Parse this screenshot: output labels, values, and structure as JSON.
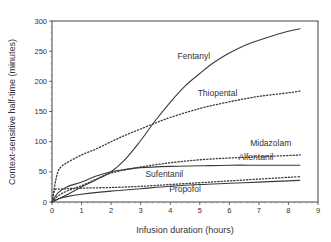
{
  "chart_data": {
    "type": "line",
    "title": "",
    "xlabel": "Infusion duration (hours)",
    "ylabel": "Context-sensitive half-time (minutes)",
    "xlim": [
      0,
      9
    ],
    "ylim": [
      0,
      300
    ],
    "xticks": [
      0,
      1,
      2,
      3,
      4,
      5,
      6,
      7,
      8,
      9
    ],
    "yticks": [
      0,
      50,
      100,
      150,
      200,
      250,
      300
    ],
    "grid": false,
    "legend": "none (inline labels)",
    "series": [
      {
        "name": "Fentanyl",
        "style": "solid",
        "x": [
          0,
          0.5,
          1,
          1.5,
          2,
          2.5,
          3,
          3.5,
          4,
          4.5,
          5,
          5.5,
          6,
          6.5,
          7,
          7.5,
          8,
          8.4
        ],
        "y": [
          0,
          12,
          25,
          37,
          50,
          72,
          102,
          135,
          165,
          192,
          213,
          232,
          247,
          259,
          268,
          276,
          283,
          287
        ]
      },
      {
        "name": "Thiopental",
        "style": "dotted",
        "x": [
          0,
          0.1,
          0.2,
          0.3,
          0.5,
          1,
          1.5,
          2,
          2.5,
          3,
          3.5,
          4,
          5,
          6,
          7,
          8,
          8.4
        ],
        "y": [
          0,
          30,
          50,
          58,
          65,
          78,
          88,
          100,
          111,
          121,
          131,
          140,
          155,
          166,
          175,
          181,
          184
        ]
      },
      {
        "name": "Midazolam",
        "style": "dotted",
        "x": [
          0,
          0.2,
          0.5,
          1,
          1.5,
          2,
          3,
          4,
          5,
          6,
          7,
          8,
          8.4
        ],
        "y": [
          0,
          10,
          18,
          27,
          38,
          48,
          58,
          65,
          70,
          73,
          75,
          77,
          78
        ]
      },
      {
        "name": "Alfentanil",
        "style": "solid",
        "x": [
          0,
          0.2,
          0.5,
          1,
          1.5,
          2,
          2.5,
          3,
          4,
          5,
          6,
          7,
          8,
          8.4
        ],
        "y": [
          0,
          15,
          25,
          33,
          43,
          50,
          54,
          57,
          59,
          60,
          61,
          61,
          61,
          61
        ]
      },
      {
        "name": "Sufentanil",
        "style": "solid",
        "x": [
          0,
          0.2,
          0.5,
          1,
          2,
          3,
          4,
          5,
          6,
          7,
          8,
          8.4
        ],
        "y": [
          0,
          5,
          9,
          13,
          18,
          22,
          26,
          29,
          31,
          33,
          35,
          36
        ]
      },
      {
        "name": "Propofol",
        "style": "dotted",
        "x": [
          0,
          0.1,
          0.3,
          0.5,
          1,
          2,
          3,
          4,
          5,
          6,
          7,
          8,
          8.4
        ],
        "y": [
          0,
          20,
          21,
          22,
          23,
          24,
          26,
          29,
          32,
          35,
          38,
          41,
          42
        ]
      }
    ],
    "annotations": [
      {
        "text": "Fentanyl",
        "x": 4.8,
        "y": 237
      },
      {
        "text": "Thiopental",
        "x": 5.6,
        "y": 175
      },
      {
        "text": "Midazolam",
        "x": 7.4,
        "y": 92
      },
      {
        "text": "Alfentanil",
        "x": 6.9,
        "y": 70
      },
      {
        "text": "Sufentanil",
        "x": 3.8,
        "y": 42
      },
      {
        "text": "Propofol",
        "x": 4.5,
        "y": 17
      }
    ]
  }
}
